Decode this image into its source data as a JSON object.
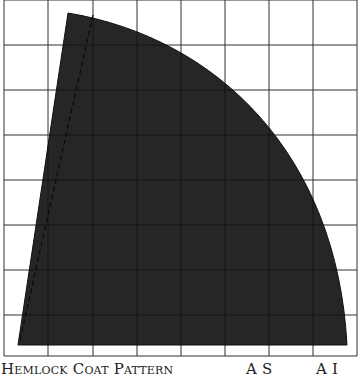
{
  "diagram": {
    "type": "sewing-pattern-piece",
    "grid": {
      "color": "#555555",
      "vertical_lines_x": [
        4,
        48,
        93,
        137,
        181,
        225,
        269,
        313,
        357
      ],
      "horizontal_lines_y": [
        0,
        45,
        90,
        135,
        180,
        225,
        270,
        315,
        356
      ]
    },
    "piece": {
      "fill": "#262626",
      "stroke": "#111111",
      "apex": [
        68,
        13
      ],
      "bottom_left": [
        18,
        345
      ],
      "bottom_right": [
        347,
        345
      ],
      "dashed_line": {
        "from": [
          93,
          15
        ],
        "to": [
          20,
          340
        ],
        "color": "#0a0a0a"
      }
    }
  },
  "caption": {
    "left": "Hemlock Coat Pattern",
    "mid": "A S",
    "right": "A I"
  }
}
